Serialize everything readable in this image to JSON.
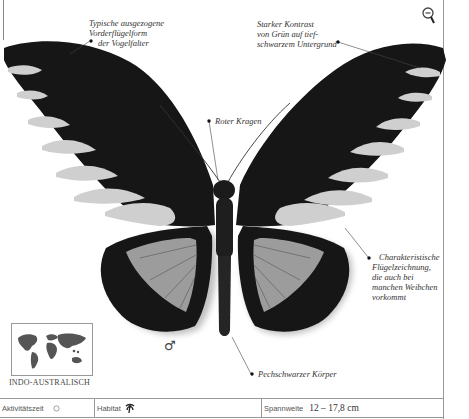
{
  "labels": {
    "forewing_shape": [
      "Typische ausgezogene",
      "Vorderflügelform",
      "der Vogelfalter"
    ],
    "contrast": [
      "Starker Kontrast",
      "von Grün auf tief-",
      "schwarzem Untergrund"
    ],
    "collar": "Roter Kragen",
    "wing_pattern": [
      "Charakteristische",
      "Flügelzeichnung,",
      "die auch bei",
      "manchen Weibchen",
      "vorkommt"
    ],
    "body": "Pechschwarzer Körper"
  },
  "sex_symbol": "♂",
  "region": {
    "caption": "INDO-AUSTRALISCH",
    "icon": "world-map-icon"
  },
  "zoom_control": {
    "icon": "zoom-out-icon"
  },
  "footer": {
    "activity": {
      "label": "Aktivitätszeit",
      "icon": "sun-icon"
    },
    "habitat": {
      "label": "Habitat",
      "icon": "palm-tree-icon"
    },
    "wingspan": {
      "label": "Spannweite",
      "value": "12 – 17,8 cm"
    }
  },
  "colors": {
    "wing_black": "#141414",
    "wing_band": "#c9c9c9",
    "hindwing_patch": "#9a9a9a",
    "rule": "#999999"
  }
}
